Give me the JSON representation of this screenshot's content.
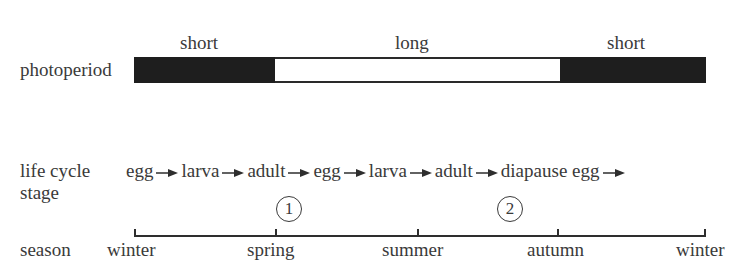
{
  "photoperiod": {
    "row_label": "photoperiod",
    "segments": [
      {
        "label": "short",
        "fill": "dark",
        "color": "#1e1e1e"
      },
      {
        "label": "long",
        "fill": "light",
        "color": "#ffffff"
      },
      {
        "label": "short",
        "fill": "dark",
        "color": "#1e1e1e"
      }
    ]
  },
  "life_cycle": {
    "row_label_line1": "life cycle",
    "row_label_line2": "stage",
    "stages": [
      "egg",
      "larva",
      "adult",
      "egg",
      "larva",
      "adult",
      "diapause egg"
    ],
    "markers": [
      {
        "number": "1",
        "under_stage": "adult (first)"
      },
      {
        "number": "2",
        "under_stage": "adult (second)"
      }
    ]
  },
  "season": {
    "row_label": "season",
    "ticks": [
      "winter",
      "spring",
      "summer",
      "autumn",
      "winter"
    ]
  },
  "icons": {
    "arrow": "right-arrow-icon",
    "marker": "circled-number-icon"
  }
}
